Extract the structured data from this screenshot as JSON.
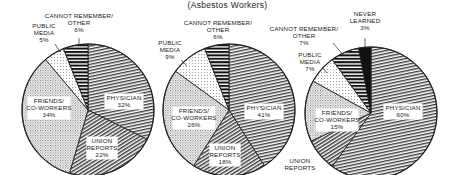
{
  "subtitle": "(Asbestos Workers)",
  "chart_data": [
    {
      "type": "pie",
      "title": "",
      "start_angle_deg": 0,
      "direction": "clockwise",
      "slices": [
        {
          "label": "PHYSICIAN",
          "value": 32,
          "pattern": "fine-lines"
        },
        {
          "label": "UNION REPORTS",
          "value": 22,
          "pattern": "diag-lines"
        },
        {
          "label": "FRIENDS/ CO-WORKERS",
          "value": 34,
          "pattern": "stipple"
        },
        {
          "label": "PUBLIC MEDIA",
          "value": 5,
          "pattern": "light-stipple"
        },
        {
          "label": "CANNOT REMEMBER/ OTHER",
          "value": 6,
          "pattern": "bold-stripes"
        }
      ]
    },
    {
      "type": "pie",
      "title": "",
      "start_angle_deg": 0,
      "direction": "clockwise",
      "slices": [
        {
          "label": "PHYSICIAN",
          "value": 41,
          "pattern": "fine-lines"
        },
        {
          "label": "UNION REPORTS",
          "value": 18,
          "pattern": "diag-lines"
        },
        {
          "label": "FRIENDS/ CO-WORKERS",
          "value": 26,
          "pattern": "stipple"
        },
        {
          "label": "PUBLIC MEDIA",
          "value": 9,
          "pattern": "light-stipple"
        },
        {
          "label": "CANNOT REMEMBER/ OTHER",
          "value": 6,
          "pattern": "bold-stripes"
        }
      ]
    },
    {
      "type": "pie",
      "title": "",
      "start_angle_deg": 0,
      "direction": "clockwise",
      "slices": [
        {
          "label": "PHYSICIAN",
          "value": 60,
          "pattern": "fine-lines"
        },
        {
          "label": "UNION REPORTS",
          "value": 8,
          "pattern": "diag-lines"
        },
        {
          "label": "FRIENDS/ CO-WORKERS",
          "value": 15,
          "pattern": "stipple"
        },
        {
          "label": "PUBLIC MEDIA",
          "value": 7,
          "pattern": "light-stipple"
        },
        {
          "label": "CANNOT REMEMBER/ OTHER",
          "value": 7,
          "pattern": "bold-stripes"
        },
        {
          "label": "NEVER LEARNED",
          "value": 3,
          "pattern": "solid-black"
        }
      ]
    }
  ],
  "pies": [
    {
      "cx": 88,
      "cy": 110,
      "r": 66,
      "inside_labels": [
        {
          "lines": [
            "PHYSICIAN",
            "32%"
          ],
          "x": 124,
          "y": 100
        },
        {
          "lines": [
            "UNION",
            "REPORTS",
            "22%"
          ],
          "x": 102,
          "y": 143
        },
        {
          "lines": [
            "FRIENDS/",
            "CO-WORKERS",
            "34%"
          ],
          "x": 49,
          "y": 103
        }
      ],
      "outside_labels": [
        {
          "lines": [
            "CANNOT REMEMBER/",
            "OTHER",
            "6%"
          ],
          "x": 79,
          "y": 18,
          "leader": [
            79,
            38,
            79,
            46
          ]
        },
        {
          "lines": [
            "PUBLIC",
            "MEDIA",
            "5%"
          ],
          "x": 44,
          "y": 28,
          "leader": [
            55,
            44,
            60,
            52
          ]
        }
      ]
    },
    {
      "cx": 229,
      "cy": 110,
      "r": 66,
      "inside_labels": [
        {
          "lines": [
            "PHYSICIAN",
            "41%"
          ],
          "x": 264,
          "y": 110
        },
        {
          "lines": [
            "UNION",
            "REPORTS",
            "18%"
          ],
          "x": 225,
          "y": 150
        },
        {
          "lines": [
            "FRIENDS/",
            "CO-WORKERS",
            "26%"
          ],
          "x": 194,
          "y": 113
        }
      ],
      "outside_labels": [
        {
          "lines": [
            "CANNOT REMEMBER/",
            "OTHER",
            "6%"
          ],
          "x": 218,
          "y": 25,
          "leader": [
            218,
            44,
            218,
            46
          ]
        },
        {
          "lines": [
            "PUBLIC",
            "MEDIA",
            "9%"
          ],
          "x": 170,
          "y": 45,
          "leader": [
            181,
            60,
            187,
            66
          ]
        }
      ]
    },
    {
      "cx": 371,
      "cy": 113,
      "r": 66,
      "inside_labels": [
        {
          "lines": [
            "PHYSICIAN",
            "60%"
          ],
          "x": 403,
          "y": 110
        },
        {
          "lines": [
            "FRIENDS/",
            "CO-WORKERS",
            "15%"
          ],
          "x": 337,
          "y": 115
        }
      ],
      "outside_labels": [
        {
          "lines": [
            "NEVER",
            "LEARNED",
            "3%"
          ],
          "x": 365,
          "y": 16,
          "leader": [
            365,
            38,
            365,
            47
          ]
        },
        {
          "lines": [
            "CANNOT REMEMBER/",
            "OTHER",
            "7%"
          ],
          "x": 304,
          "y": 31,
          "leader": [
            333,
            43,
            344,
            56
          ]
        },
        {
          "lines": [
            "PUBLIC",
            "MEDIA",
            "7%"
          ],
          "x": 310,
          "y": 57,
          "leader": [
            322,
            67,
            327,
            73
          ]
        },
        {
          "lines": [
            "UNION",
            "REPORTS"
          ],
          "x": 300,
          "y": 163,
          "leader": null
        }
      ]
    }
  ]
}
